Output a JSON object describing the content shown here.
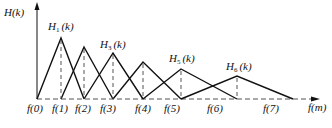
{
  "y_axis_label": "H(k)",
  "x_axis_label": "f(m)",
  "filters": [
    {
      "name": "H",
      "sub": "1",
      "suffix": "(k)",
      "label_visible": true
    },
    {
      "name": "H",
      "sub": "2",
      "suffix": "(k)",
      "label_visible": false
    },
    {
      "name": "H",
      "sub": "3",
      "suffix": "(k)",
      "label_visible": true
    },
    {
      "name": "H",
      "sub": "4",
      "suffix": "(k)",
      "label_visible": false
    },
    {
      "name": "H",
      "sub": "5",
      "suffix": "(k)",
      "label_visible": true
    },
    {
      "name": "H",
      "sub": "6",
      "suffix": "(k)",
      "label_visible": true
    }
  ],
  "x_ticks": [
    "f(0)",
    "f(1)",
    "f(2)",
    "f(3)",
    "f(4)",
    "f(5)",
    "f(6)",
    "f(7)"
  ],
  "colors": {
    "line": "#111111",
    "dashed": "#555555"
  }
}
